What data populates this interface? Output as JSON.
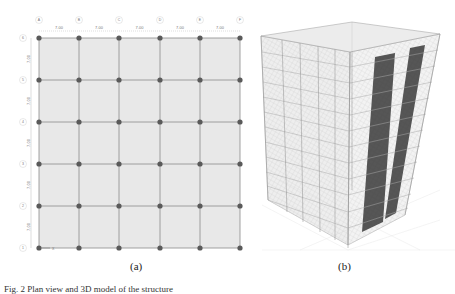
{
  "figure": {
    "subfigures": [
      {
        "id": "a",
        "label": "(a)",
        "description": "Structural floor plan grid (5 x 5 bays)",
        "column_axes": [
          "A",
          "B",
          "C",
          "D",
          "E",
          "F"
        ],
        "row_axes": [
          "6",
          "5",
          "4",
          "3",
          "2",
          "1"
        ],
        "column_spacings": [
          "7.00",
          "7.00",
          "7.00",
          "7.00",
          "7.00"
        ],
        "row_spacings": [
          "7.00",
          "7.00",
          "7.00",
          "7.00",
          "7.00"
        ],
        "origin_marker": "X",
        "colors": {
          "slab": "#e6e6e6",
          "beam": "#8a8a8a",
          "column": "#5a5a5a",
          "dim": "#9a9a9a"
        }
      },
      {
        "id": "b",
        "label": "(b)",
        "description": "3D structural model of multi-storey frame with shear walls",
        "stories": 12,
        "colors": {
          "frame": "#9c9c9c",
          "slab": "#cfcfcf",
          "shear_wall": "#3a3a3a"
        }
      }
    ],
    "caption": "Fig. 2    Plan view and 3D model of the structure"
  }
}
